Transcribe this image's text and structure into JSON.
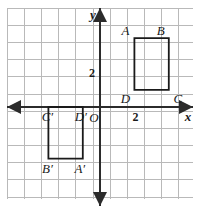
{
  "chart_data": {
    "type": "scatter",
    "title": "",
    "xlabel": "x",
    "ylabel": "y",
    "grid": true,
    "grid_spacing": 1,
    "xlim": [
      -5.5,
      5.4
    ],
    "ylim": [
      -5.4,
      5.8
    ],
    "origin_label": "O",
    "x_tick_labels": [
      {
        "value": 2,
        "text": "2"
      }
    ],
    "y_tick_labels": [
      {
        "value": 2,
        "text": "2"
      }
    ],
    "axis_arrows": [
      "left",
      "right",
      "up",
      "down"
    ],
    "shapes": [
      {
        "name": "rectangle-abcd",
        "kind": "rectangle",
        "vertices": [
          {
            "label": "A",
            "x": 2,
            "y": 4
          },
          {
            "label": "B",
            "x": 4,
            "y": 4
          },
          {
            "label": "C",
            "x": 4,
            "y": 1
          },
          {
            "label": "D",
            "x": 2,
            "y": 1
          }
        ]
      },
      {
        "name": "rectangle-a-prime-b-prime-c-prime-d-prime",
        "kind": "rectangle",
        "vertices": [
          {
            "label": "C′",
            "x": -3,
            "y": 0
          },
          {
            "label": "D′",
            "x": -1,
            "y": 0
          },
          {
            "label": "A′",
            "x": -1,
            "y": -3
          },
          {
            "label": "B′",
            "x": -3,
            "y": -3
          }
        ]
      }
    ],
    "colors": {
      "grid": "#b9b9b9",
      "axis": "#2b2b2b",
      "shape_stroke": "#1a1a1a",
      "background": "#ffffff",
      "text": "#1a1a1a"
    }
  },
  "labels": {
    "x_axis": "x",
    "y_axis": "y",
    "origin": "O",
    "x_tick_2": "2",
    "y_tick_2": "2",
    "A": "A",
    "B": "B",
    "C": "C",
    "D": "D",
    "A_prime": "A′",
    "B_prime": "B′",
    "C_prime": "C′",
    "D_prime": "D′"
  }
}
